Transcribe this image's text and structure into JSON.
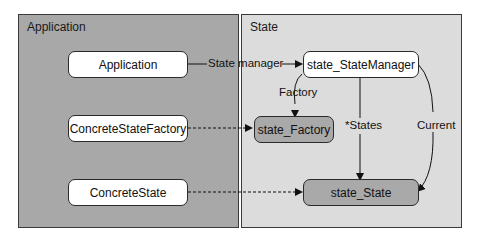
{
  "panels": {
    "application": {
      "title": "Application"
    },
    "state": {
      "title": "State"
    }
  },
  "nodes": {
    "application": "Application",
    "concrete_state_factory": "ConcreteStateFactory",
    "concrete_state": "ConcreteState",
    "state_manager": "state_StateManager",
    "state_factory": "state_Factory",
    "state_state": "state_State"
  },
  "edges": {
    "state_manager": "State manager",
    "factory": "Factory",
    "states": "*States",
    "current": "Current"
  },
  "colors": {
    "application_panel": "#a8a8a8",
    "state_panel": "#dcdcdc",
    "abstract_node": "#a9a9a9",
    "concrete_node": "#ffffff"
  }
}
